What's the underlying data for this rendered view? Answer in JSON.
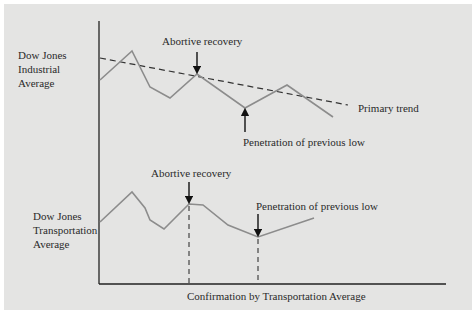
{
  "diagram": {
    "colors": {
      "background": "#e4e4e3",
      "axis": "#222222",
      "series_line": "#8c8c8c",
      "trend_line": "#333333",
      "arrow": "#111111"
    },
    "upper_panel": {
      "series_label_lines": [
        "Dow Jones",
        "Industrial",
        "Average"
      ],
      "annotation_top": "Abortive recovery",
      "annotation_bottom": "Penetration of previous low",
      "trend_label": "Primary trend",
      "series_points": [
        [
          100,
          80
        ],
        [
          132,
          51
        ],
        [
          150,
          87
        ],
        [
          170,
          98
        ],
        [
          197,
          74
        ],
        [
          245,
          108
        ],
        [
          287,
          85
        ],
        [
          333,
          117
        ]
      ],
      "trend_points": [
        [
          100,
          58
        ],
        [
          348,
          105
        ]
      ]
    },
    "lower_panel": {
      "series_label_lines": [
        "Dow Jones",
        "Transportation",
        "Average"
      ],
      "annotation_left": "Abortive recovery",
      "annotation_right": "Penetration of previous low",
      "series_points": [
        [
          100,
          222
        ],
        [
          132,
          192
        ],
        [
          145,
          208
        ],
        [
          150,
          220
        ],
        [
          164,
          229
        ],
        [
          189,
          204
        ],
        [
          203,
          205
        ],
        [
          228,
          225
        ],
        [
          258,
          237
        ],
        [
          314,
          218
        ]
      ],
      "confirmation_x": [
        189,
        258
      ]
    },
    "x_axis_label": "Confirmation by Transportation Average"
  }
}
